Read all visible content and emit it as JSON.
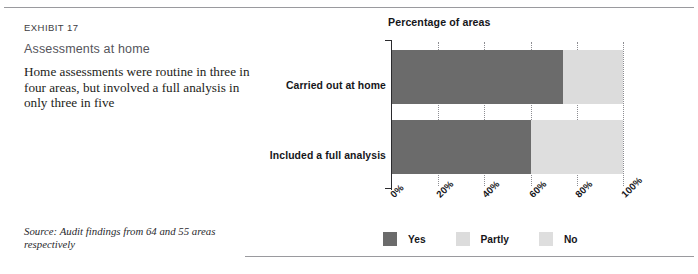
{
  "exhibit": {
    "kicker": "EXHIBIT 17",
    "title": "Assessments at home",
    "description": "Home assessments were routine in three in four areas, but involved a full analysis in only three in five",
    "source": "Source: Audit findings from 64 and 55 areas respectively"
  },
  "chart_data": {
    "type": "bar",
    "orientation": "horizontal",
    "stacked": true,
    "title": "Percentage of areas",
    "xlabel": "",
    "ylabel": "",
    "xlim": [
      0,
      100
    ],
    "grid": true,
    "legend_position": "bottom",
    "tick_labels": [
      "0%",
      "20%",
      "40%",
      "60%",
      "80%",
      "100%"
    ],
    "tick_values": [
      0,
      20,
      40,
      60,
      80,
      100
    ],
    "categories": [
      "Carried out at home",
      "Included a full analysis"
    ],
    "series": [
      {
        "name": "Yes",
        "color": "#6b6b6b",
        "values": [
          74,
          60
        ]
      },
      {
        "name": "Partly",
        "color": "#dcdcdc",
        "values": [
          26,
          0
        ]
      },
      {
        "name": "No",
        "color": "#dedede",
        "values": [
          0,
          40
        ]
      }
    ],
    "legend": [
      {
        "label": "Yes",
        "color": "#6b6b6b"
      },
      {
        "label": "Partly",
        "color": "#dcdcdc"
      },
      {
        "label": "No",
        "color": "#dedede"
      }
    ]
  },
  "colors": {
    "yes": "#6b6b6b",
    "partly": "#dcdcdc",
    "no": "#dedede",
    "rule": "#9a9a9e",
    "axis": "#2b2b2e"
  }
}
